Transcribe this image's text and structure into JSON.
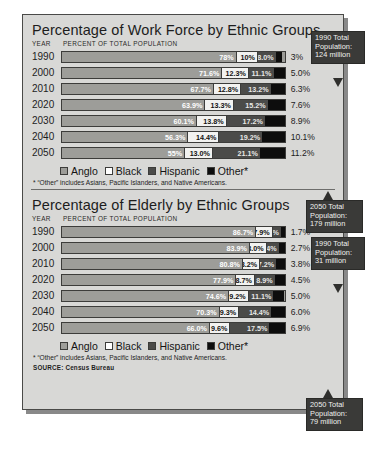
{
  "source": "SOURCE: Census Bureau",
  "legend": {
    "items": [
      {
        "label": "Anglo",
        "key": "anglo"
      },
      {
        "label": "Black",
        "key": "black"
      },
      {
        "label": "Hispanic",
        "key": "hispanic"
      },
      {
        "label": "Other*",
        "key": "other"
      }
    ]
  },
  "footnote": "* “Other” includes Asians, Pacific Islanders, and Native Americans.",
  "headers": {
    "year": "YEAR",
    "percent": "PERCENT OF TOTAL POPULATION"
  },
  "colors": {
    "anglo": "#9d9d99",
    "black": "#f2f2f0",
    "hispanic": "#4b4b49",
    "other": "#0d0d0d",
    "panel": "#d8d8d6",
    "callout": "#3a3a38"
  },
  "chart_data": [
    {
      "type": "bar",
      "id": "work-force",
      "title": "Percentage of Work Force by Ethnic Groups",
      "xlabel": "PERCENT OF TOTAL POPULATION",
      "ylabel": "YEAR",
      "categories": [
        "1990",
        "2000",
        "2010",
        "2020",
        "2030",
        "2040",
        "2050"
      ],
      "stacked": true,
      "xlim": [
        0,
        100
      ],
      "series": [
        {
          "name": "Anglo",
          "values": [
            78,
            71.6,
            67.7,
            63.9,
            60.1,
            56.3,
            55
          ]
        },
        {
          "name": "Black",
          "values": [
            10,
            12.3,
            12.8,
            13.3,
            13.8,
            14.4,
            13.0
          ]
        },
        {
          "name": "Hispanic",
          "values": [
            8.0,
            11.1,
            13.2,
            15.2,
            17.2,
            19.2,
            21.1
          ]
        },
        {
          "name": "Other*",
          "values": [
            3,
            5.0,
            6.3,
            7.6,
            8.9,
            10.1,
            11.2
          ]
        }
      ],
      "labels": {
        "anglo": [
          "78%",
          "71.6%",
          "67.7%",
          "63.9%",
          "60.1%",
          "56.3%",
          "55%"
        ],
        "black": [
          "10%",
          "12.3%",
          "12.8%",
          "13.3%",
          "13.8%",
          "14.4%",
          "13.0%"
        ],
        "hispanic": [
          "8.0%",
          "11.1%",
          "13.2%",
          "15.2%",
          "17.2%",
          "19.2%",
          "21.1%"
        ],
        "other": [
          "3%",
          "5.0%",
          "6.3%",
          "7.6%",
          "8.9%",
          "10.1%",
          "11.2%"
        ]
      },
      "callouts": {
        "first": [
          "1990 Total",
          "Population:",
          "124 million"
        ],
        "last": [
          "2050 Total",
          "Population:",
          "179 million"
        ]
      }
    },
    {
      "type": "bar",
      "id": "elderly",
      "title": "Percentage of Elderly by Ethnic Groups",
      "xlabel": "PERCENT OF TOTAL POPULATION",
      "ylabel": "YEAR",
      "categories": [
        "1990",
        "2000",
        "2010",
        "2020",
        "2030",
        "2040",
        "2050"
      ],
      "stacked": true,
      "xlim": [
        0,
        100
      ],
      "series": [
        {
          "name": "Anglo",
          "values": [
            86.7,
            83.9,
            80.8,
            77.9,
            74.6,
            70.3,
            66.0
          ]
        },
        {
          "name": "Black",
          "values": [
            7.9,
            8.0,
            8.2,
            8.7,
            9.2,
            9.3,
            9.6
          ]
        },
        {
          "name": "Hispanic",
          "values": [
            3.7,
            5.4,
            7.2,
            8.9,
            11.1,
            14.4,
            17.5
          ]
        },
        {
          "name": "Other*",
          "values": [
            1.7,
            2.7,
            3.8,
            4.5,
            5.0,
            6.0,
            6.9
          ]
        }
      ],
      "labels": {
        "anglo": [
          "86.7%",
          "83.9%",
          "80.8%",
          "77.9%",
          "74.6%",
          "70.3%",
          "66.0%"
        ],
        "black": [
          "7.9%",
          "8.0%",
          "8.2%",
          "8.7%",
          "9.2%",
          "9.3%",
          "9.6%"
        ],
        "hispanic": [
          "3.7%",
          "5.4%",
          "7.2%",
          "8.9%",
          "11.1%",
          "14.4%",
          "17.5%"
        ],
        "other": [
          "1.7%",
          "2.7%",
          "3.8%",
          "4.5%",
          "5.0%",
          "6.0%",
          "6.9%"
        ]
      },
      "callouts": {
        "first": [
          "1990 Total",
          "Population:",
          "31 million"
        ],
        "last": [
          "2050 Total",
          "Population:",
          "79 million"
        ]
      }
    }
  ]
}
